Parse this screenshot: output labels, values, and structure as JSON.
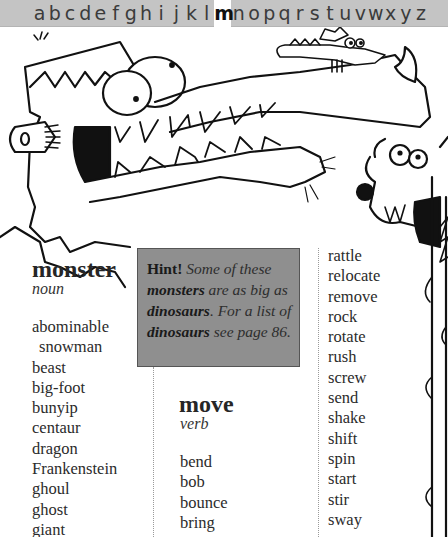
{
  "alphabet": {
    "letters": [
      "a",
      "b",
      "c",
      "d",
      "e",
      "f",
      "g",
      "h",
      "i",
      "j",
      "k",
      "l",
      "m",
      "n",
      "o",
      "p",
      "q",
      "r",
      "s",
      "t",
      "u",
      "v",
      "w",
      "x",
      "y",
      "z"
    ],
    "active": "m"
  },
  "colors": {
    "alpha_bar_bg": "#c4c4c4",
    "hint_bg": "#8f8f8f"
  },
  "illustration": {
    "description": "cartoon monsters: long-snouted Frankenstein-like monster with bolt, small winged dragon on snout, horned multi-eyed monster at right"
  },
  "entries": [
    {
      "word": "monster",
      "part_of_speech": "noun",
      "synonyms": [
        "abominable",
        "snowman",
        "beast",
        "big-foot",
        "bunyip",
        "centaur",
        "dragon",
        "Frankenstein",
        "ghoul",
        "ghost",
        "giant"
      ]
    },
    {
      "word": "move",
      "part_of_speech": "verb",
      "synonyms": [
        "bend",
        "bob",
        "bounce",
        "bring"
      ]
    },
    {
      "word": "move-continued",
      "part_of_speech": "",
      "synonyms": [
        "rattle",
        "relocate",
        "remove",
        "rock",
        "rotate",
        "rush",
        "screw",
        "send",
        "shake",
        "shift",
        "spin",
        "start",
        "stir",
        "sway"
      ]
    }
  ],
  "hint": {
    "label": "Hint!",
    "t1": " Some of these ",
    "b1": "monsters",
    "t2": " are as big as ",
    "b2": "dinosaurs",
    "t3": ". For a list of ",
    "b3": "dinosaurs",
    "t4": " see page 86."
  }
}
